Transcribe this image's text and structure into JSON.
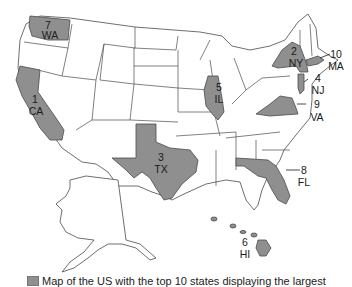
{
  "map": {
    "title": "US map of top 10 states",
    "highlight_color": "#8f8f8f",
    "states": [
      {
        "rank": "1",
        "abbr": "CA"
      },
      {
        "rank": "2",
        "abbr": "NY"
      },
      {
        "rank": "3",
        "abbr": "TX"
      },
      {
        "rank": "4",
        "abbr": "NJ"
      },
      {
        "rank": "5",
        "abbr": "IL"
      },
      {
        "rank": "6",
        "abbr": "HI"
      },
      {
        "rank": "7",
        "abbr": "WA"
      },
      {
        "rank": "8",
        "abbr": "FL"
      },
      {
        "rank": "9",
        "abbr": "VA"
      },
      {
        "rank": "10",
        "abbr": "MA"
      }
    ]
  },
  "legend": {
    "text": "Map of the US with the top 10 states displaying the largest"
  }
}
